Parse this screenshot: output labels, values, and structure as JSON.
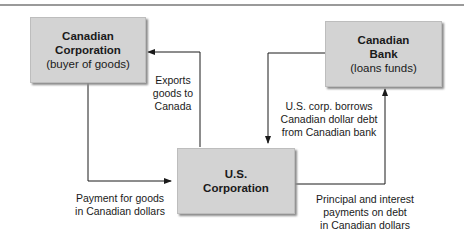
{
  "diagram": {
    "nodes": {
      "canadian_corporation": {
        "title_line1": "Canadian",
        "title_line2": "Corporation",
        "subtitle": "(buyer of goods)"
      },
      "canadian_bank": {
        "title_line1": "Canadian",
        "title_line2": "Bank",
        "subtitle": "(loans funds)"
      },
      "us_corporation": {
        "title_line1": "U.S.",
        "title_line2": "Corporation"
      }
    },
    "edges": {
      "exports": {
        "line1": "Exports",
        "line2": "goods to",
        "line3": "Canada"
      },
      "payment": {
        "line1": "Payment for goods",
        "line2": "in Canadian dollars"
      },
      "borrow": {
        "line1": "U.S. corp. borrows",
        "line2": "Canadian dollar debt",
        "line3": "from Canadian bank"
      },
      "repay": {
        "line1": "Principal and interest",
        "line2": "payments on debt",
        "line3": "in Canadian dollars"
      }
    },
    "colors": {
      "box_fill": "#d3d3d3",
      "line": "#1a1a1a",
      "top_rule": "#9a9a9a"
    }
  }
}
